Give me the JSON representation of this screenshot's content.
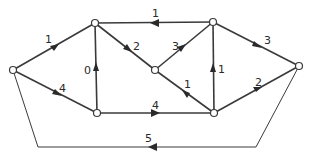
{
  "diagram": {
    "type": "directed network graph",
    "nodes": [
      {
        "id": "A",
        "x": 13,
        "y": 70
      },
      {
        "id": "B",
        "x": 95,
        "y": 23
      },
      {
        "id": "C",
        "x": 97,
        "y": 113
      },
      {
        "id": "D",
        "x": 155,
        "y": 70
      },
      {
        "id": "E",
        "x": 213,
        "y": 22
      },
      {
        "id": "F",
        "x": 214,
        "y": 113
      },
      {
        "id": "G",
        "x": 299,
        "y": 66
      }
    ],
    "edges": [
      {
        "from": "A",
        "to": "B",
        "weight": "1"
      },
      {
        "from": "A",
        "to": "C",
        "weight": "4"
      },
      {
        "from": "C",
        "to": "B",
        "weight": "0"
      },
      {
        "from": "E",
        "to": "B",
        "weight": "1"
      },
      {
        "from": "B",
        "to": "D",
        "weight": "2"
      },
      {
        "from": "C",
        "to": "F",
        "weight": "4"
      },
      {
        "from": "D",
        "to": "E",
        "weight": "3"
      },
      {
        "from": "F",
        "to": "D",
        "weight": "1"
      },
      {
        "from": "F",
        "to": "E",
        "weight": "1"
      },
      {
        "from": "E",
        "to": "G",
        "weight": "3"
      },
      {
        "from": "F",
        "to": "G",
        "weight": "2"
      },
      {
        "from": "G",
        "to": "A",
        "weight": "5",
        "routed": "below"
      }
    ]
  }
}
